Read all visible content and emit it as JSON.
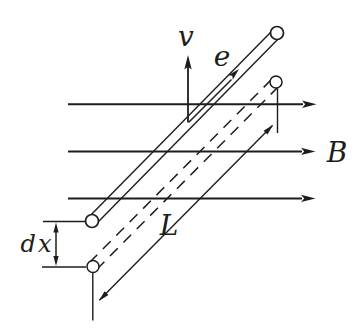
{
  "figure": {
    "type": "physics-electromagnetic-induction-diagram",
    "colors": {
      "background": "#ffffff",
      "ink": "#1d1d1b"
    },
    "labels": {
      "velocity": "v",
      "electron": "e",
      "magnetic_field": "B",
      "rod_length": "L",
      "displacement": "dx"
    }
  }
}
